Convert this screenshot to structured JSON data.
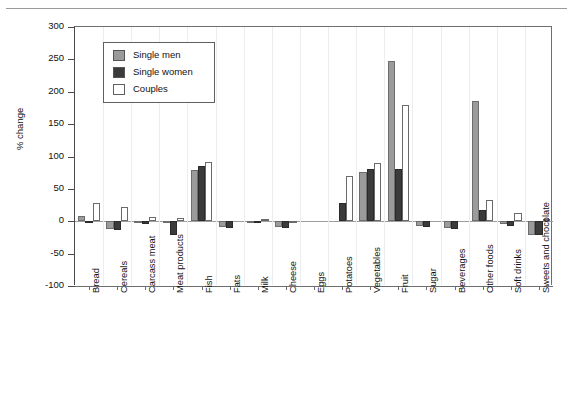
{
  "chart_data": {
    "type": "bar",
    "title": "",
    "subtitle": "",
    "xlabel": "",
    "ylabel": "% change",
    "ylim": [
      -100,
      300
    ],
    "yticks": [
      -100,
      -50,
      0,
      50,
      100,
      150,
      200,
      250,
      300
    ],
    "ytick_labels": [
      "-100",
      "-50",
      "0",
      "50",
      "100",
      "150",
      "200",
      "250",
      "300"
    ],
    "grid": "vertical-category-separators",
    "legend_position": "upper-left-inside",
    "zero_reference_line": 0,
    "categories": [
      "Bread",
      "Cereals",
      "Carcass meat",
      "Meat products",
      "Fish",
      "Fats",
      "Milk",
      "Cheese",
      "Eggs",
      "Potatoes",
      "Vegetables",
      "Fruit",
      "Sugar",
      "Beverages",
      "Other foods",
      "Soft drinks",
      "Sweets and chocolate"
    ],
    "series": [
      {
        "name": "Single men",
        "color": "#9b9b9b",
        "values": [
          8,
          -12,
          -3,
          -2,
          79,
          -9,
          -2,
          -9,
          0,
          0,
          76,
          247,
          -8,
          -10,
          185,
          -4,
          -21
        ]
      },
      {
        "name": "Single women",
        "color": "#3b3b3b",
        "values": [
          -3,
          -13,
          -4,
          -21,
          85,
          -10,
          -3,
          -11,
          0,
          28,
          80,
          81,
          -9,
          -12,
          18,
          -8,
          -22
        ]
      },
      {
        "name": "Couples",
        "color": "#ffffff",
        "values": [
          28,
          22,
          6,
          5,
          92,
          0,
          4,
          -2,
          0,
          70,
          90,
          179,
          0,
          0,
          33,
          13,
          3
        ]
      }
    ]
  },
  "legend": {
    "items": [
      {
        "label": "Single men",
        "swatch": "#9b9b9b"
      },
      {
        "label": "Single women",
        "swatch": "#3b3b3b"
      },
      {
        "label": "Couples",
        "swatch": "#ffffff"
      }
    ]
  }
}
